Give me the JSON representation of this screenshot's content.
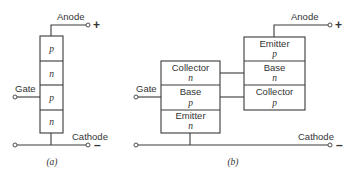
{
  "diagram_a": {
    "anode_label": "Anode",
    "anode_sign": "+",
    "gate_label": "Gate",
    "cathode_label": "Cathode",
    "cathode_sign": "–",
    "layers": [
      "p",
      "n",
      "p",
      "n"
    ],
    "caption": "(a)"
  },
  "diagram_b": {
    "anode_label": "Anode",
    "anode_sign": "+",
    "gate_label": "Gate",
    "cathode_label": "Cathode",
    "cathode_sign": "–",
    "npn_transistor": [
      {
        "region": "Collector",
        "type": "n"
      },
      {
        "region": "Base",
        "type": "p"
      },
      {
        "region": "Emitter",
        "type": "n"
      }
    ],
    "pnp_transistor": [
      {
        "region": "Emitter",
        "type": "p"
      },
      {
        "region": "Base",
        "type": "n"
      },
      {
        "region": "Collector",
        "type": "p"
      }
    ],
    "caption": "(b)"
  }
}
